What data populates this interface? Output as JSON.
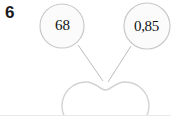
{
  "figure": {
    "label": "6",
    "background_color": "#ffffff",
    "stroke_color": "#c9c9c9",
    "node_fill_color": "#fbfbfb",
    "text_color": "#111111"
  },
  "nodes": [
    {
      "id": "node-left",
      "label": "68",
      "shape": "circle",
      "cx": 62,
      "cy": 26,
      "r": 22
    },
    {
      "id": "node-right",
      "label": "0,85",
      "shape": "circle",
      "cx": 147,
      "cy": 26,
      "r": 23
    }
  ],
  "edges": [
    {
      "id": "edge-left",
      "from": "node-left",
      "to": "body-shape",
      "x1": 78,
      "y1": 45,
      "x2": 103,
      "y2": 81
    },
    {
      "id": "edge-right",
      "from": "node-right",
      "to": "body-shape",
      "x1": 131,
      "y1": 46,
      "x2": 108,
      "y2": 82
    }
  ],
  "body_shape": {
    "id": "body-shape",
    "name": "peanut-outline",
    "description": "figure-eight / peanut shaped outline",
    "left_lobe_cx": 85,
    "right_lobe_cx": 125,
    "cy": 106,
    "lobe_r": 24
  }
}
